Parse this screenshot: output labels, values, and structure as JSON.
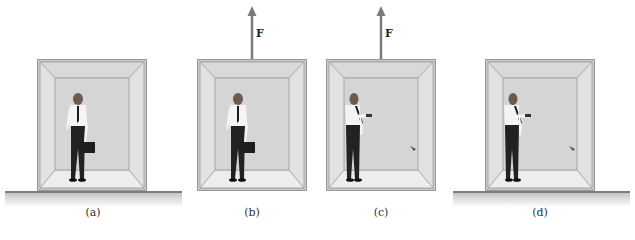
{
  "figure": {
    "panels": [
      {
        "id": "a",
        "caption": "(a)",
        "has_force": false,
        "has_ground": true,
        "pose": "holding-briefcase"
      },
      {
        "id": "b",
        "caption": "(b)",
        "has_force": true,
        "has_ground": false,
        "pose": "holding-briefcase"
      },
      {
        "id": "c",
        "caption": "(c)",
        "has_force": true,
        "has_ground": false,
        "pose": "released-briefcase"
      },
      {
        "id": "d",
        "caption": "(d)",
        "has_force": false,
        "has_ground": true,
        "pose": "released-briefcase"
      }
    ],
    "force_label": "F",
    "colors": {
      "frame": "#c8c8c8",
      "side_wall": "#e2e2e2",
      "back_wall": "#d5d5d5",
      "floor": "#ededed",
      "arrow": "#7a7a7a",
      "ground_line": "#7d7d7d"
    }
  }
}
